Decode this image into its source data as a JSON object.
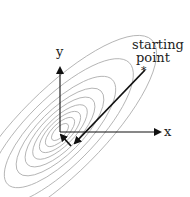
{
  "diagram": {
    "labels": {
      "x_axis": "x",
      "y_axis": "y",
      "start_line1": "starting",
      "start_line2": "point",
      "start_marker": "*"
    },
    "contours": {
      "center": [
        57,
        135
      ],
      "rotation_deg": -45,
      "count": 9,
      "color": "#a0a0a0"
    },
    "path": {
      "color": "#111111",
      "points": [
        [
          145,
          70
        ],
        [
          73,
          145
        ],
        [
          60,
          134
        ]
      ]
    }
  }
}
